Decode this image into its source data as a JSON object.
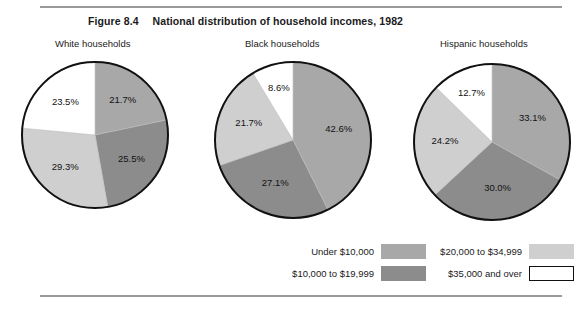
{
  "figure": {
    "number": "Figure 8.4",
    "title": "National distribution of household incomes, 1982"
  },
  "panels": [
    {
      "title": "White households"
    },
    {
      "title": "Black households"
    },
    {
      "title": "Hispanic households"
    }
  ],
  "legend": {
    "items": [
      {
        "label": "Under $10,000",
        "color": "#a8a8a8",
        "outlined": false
      },
      {
        "label": "$20,000 to $34,999",
        "color": "#cfcfcf",
        "outlined": false
      },
      {
        "label": "$10,000 to $19,999",
        "color": "#8c8c8c",
        "outlined": false
      },
      {
        "label": "$35,000 and over",
        "color": "#ffffff",
        "outlined": true
      }
    ]
  },
  "colors": {
    "under_10k": "#a8a8a8",
    "k10_to_20k": "#8c8c8c",
    "k20_to_35k": "#cfcfcf",
    "k35_and_over": "#ffffff",
    "outline": "#111111",
    "rule": "#9a9a9a"
  },
  "chart_data": [
    {
      "type": "pie",
      "title": "White households",
      "categories": [
        "Under $10,000",
        "$10,000 to $19,999",
        "$20,000 to $34,999",
        "$35,000 and over"
      ],
      "values": [
        21.7,
        25.5,
        29.3,
        23.5
      ],
      "labels": [
        "21.7%",
        "25.5%",
        "29.3%",
        "23.5%"
      ],
      "colors": [
        "#a8a8a8",
        "#8c8c8c",
        "#cfcfcf",
        "#ffffff"
      ],
      "start_angle": 0,
      "direction": "clockwise",
      "unit": "percent"
    },
    {
      "type": "pie",
      "title": "Black households",
      "categories": [
        "Under $10,000",
        "$10,000 to $19,999",
        "$20,000 to $34,999",
        "$35,000 and over"
      ],
      "values": [
        42.6,
        27.1,
        21.7,
        8.6
      ],
      "labels": [
        "42.6%",
        "27.1%",
        "21.7%",
        "8.6%"
      ],
      "colors": [
        "#a8a8a8",
        "#8c8c8c",
        "#cfcfcf",
        "#ffffff"
      ],
      "start_angle": 0,
      "direction": "clockwise",
      "unit": "percent"
    },
    {
      "type": "pie",
      "title": "Hispanic households",
      "categories": [
        "Under $10,000",
        "$10,000 to $19,999",
        "$20,000 to $34,999",
        "$35,000 and over"
      ],
      "values": [
        33.1,
        30.0,
        24.2,
        12.7
      ],
      "labels": [
        "33.1%",
        "30.0%",
        "24.2%",
        "12.7%"
      ],
      "colors": [
        "#a8a8a8",
        "#8c8c8c",
        "#cfcfcf",
        "#ffffff"
      ],
      "start_angle": 0,
      "direction": "clockwise",
      "unit": "percent"
    }
  ],
  "geometry": {
    "pies": [
      {
        "cx": 95,
        "cy": 135,
        "r": 73,
        "label_r": 44
      },
      {
        "cx": 293,
        "cy": 140,
        "r": 78,
        "label_r": 47
      },
      {
        "cx": 492,
        "cy": 142,
        "r": 78,
        "label_r": 47
      }
    ]
  }
}
